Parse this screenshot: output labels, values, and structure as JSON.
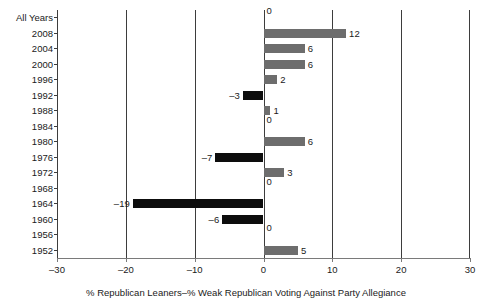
{
  "chart_data": {
    "type": "bar",
    "orientation": "horizontal",
    "title": "",
    "xlabel": "% Republican Leaners–% Weak Republican Voting Against Party Allegiance",
    "ylabel": "",
    "xlim": [
      -30,
      30
    ],
    "xticks": [
      -30,
      -20,
      -10,
      0,
      10,
      20,
      30
    ],
    "xtick_labels": [
      "–30",
      "–20",
      "–10",
      "0",
      "10",
      "20",
      "30"
    ],
    "grid": true,
    "gridlines_x": [
      -30,
      -20,
      -10,
      0,
      10,
      20,
      30
    ],
    "legend": false,
    "categories": [
      "All Years",
      "2008",
      "2004",
      "2000",
      "1996",
      "1992",
      "1988",
      "1984",
      "1980",
      "1976",
      "1972",
      "1968",
      "1964",
      "1960",
      "1956",
      "1952"
    ],
    "values": [
      0,
      12,
      6,
      6,
      2,
      -3,
      1,
      0,
      6,
      -7,
      3,
      0,
      -19,
      -6,
      0,
      5
    ],
    "data_labels": [
      "0",
      "12",
      "6",
      "6",
      "2",
      "–3",
      "1",
      "0",
      "6",
      "–7",
      "3",
      "0",
      "–19",
      "–6",
      "0",
      "5"
    ],
    "colors": {
      "positive_bar": "#6d6d6d",
      "negative_bar": "#0d0d0d",
      "axis": "#3d3d3d",
      "text": "#1a1a1a",
      "background": "#ffffff"
    }
  }
}
